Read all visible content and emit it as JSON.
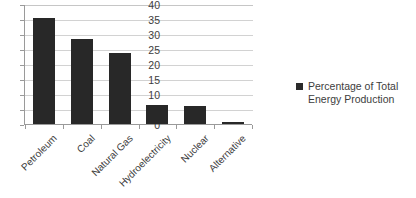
{
  "chart_data": {
    "type": "bar",
    "title": "",
    "subtitle": "",
    "xlabel": "",
    "ylabel": "",
    "categories": [
      "Petroleum",
      "Coal",
      "Natural Gas",
      "Hydroelectricity",
      "Nuclear",
      "Alternative"
    ],
    "series": [
      {
        "name": "Percentage of Total Energy Production",
        "values": [
          35.4,
          28.2,
          23.6,
          6.2,
          6.0,
          0.6
        ],
        "color": "#282828"
      }
    ],
    "ylim": [
      0,
      40
    ],
    "ytick_step": 5,
    "yticks": [
      "0",
      "5",
      "10",
      "15",
      "20",
      "25",
      "30",
      "35",
      "40"
    ],
    "grid": "horizontal",
    "legend_position": "right",
    "legend_entries": [
      {
        "label": "Percentage of Total Energy Production",
        "color": "#282828",
        "marker": "square"
      }
    ],
    "axis_color": "#9a9a9a",
    "grid_color": "#d2d2d2",
    "background": "#ffffff"
  }
}
